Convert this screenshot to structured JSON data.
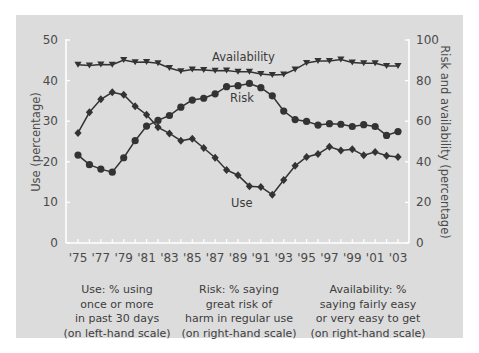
{
  "chart_data": {
    "type": "line",
    "title": "",
    "x": [
      "'75",
      "'76",
      "'77",
      "'78",
      "'79",
      "'80",
      "'81",
      "'82",
      "'83",
      "'84",
      "'85",
      "'86",
      "'87",
      "'88",
      "'89",
      "'90",
      "'91",
      "'92",
      "'93",
      "'94",
      "'95",
      "'96",
      "'97",
      "'98",
      "'99",
      "'00",
      "'01",
      "'02",
      "'03"
    ],
    "x_tick_labels": [
      "'75",
      "'77",
      "'79",
      "'81",
      "'83",
      "'85",
      "'87",
      "'89",
      "'91",
      "'93",
      "'95",
      "'97",
      "'99",
      "'01",
      "'03"
    ],
    "ylabel_left": "Use (percentage)",
    "ylabel_right": "Risk and availability (percentage)",
    "ylim_left": [
      0,
      50
    ],
    "ylim_right": [
      0,
      100
    ],
    "yticks_left": [
      "0",
      "10",
      "20",
      "30",
      "40",
      "50"
    ],
    "yticks_right": [
      "0",
      "20",
      "40",
      "60",
      "80",
      "100"
    ],
    "grid": false,
    "legend_position": "inline labels",
    "series": [
      {
        "name": "Use",
        "axis": "left",
        "marker": "diamond",
        "values": [
          27.1,
          32.2,
          35.4,
          37.1,
          36.5,
          33.7,
          31.6,
          28.5,
          27.0,
          25.2,
          25.7,
          23.4,
          21.0,
          18.0,
          16.7,
          14.0,
          13.8,
          11.9,
          15.5,
          19.0,
          21.2,
          21.9,
          23.7,
          22.8,
          23.1,
          21.6,
          22.4,
          21.5,
          21.2
        ]
      },
      {
        "name": "Risk",
        "axis": "right",
        "marker": "circle",
        "values": [
          43.3,
          38.6,
          36.4,
          34.9,
          42.0,
          50.4,
          57.6,
          60.4,
          62.8,
          66.9,
          70.4,
          71.3,
          73.5,
          77.0,
          77.5,
          78.6,
          76.5,
          72.5,
          65.0,
          60.8,
          59.9,
          58.1,
          58.8,
          58.5,
          57.4,
          58.3,
          57.4,
          53.0,
          54.9
        ]
      },
      {
        "name": "Availability",
        "axis": "right",
        "marker": "triangle-down",
        "values": [
          87.8,
          87.4,
          87.9,
          87.8,
          90.1,
          89.0,
          89.2,
          88.5,
          86.2,
          84.6,
          85.5,
          85.2,
          84.8,
          85.0,
          84.3,
          84.4,
          83.3,
          82.7,
          83.0,
          85.5,
          88.7,
          89.6,
          89.6,
          90.4,
          88.9,
          88.5,
          88.5,
          87.2,
          87.2
        ]
      }
    ],
    "annotations": [
      "Availability",
      "Risk",
      "Use"
    ]
  },
  "labels": {
    "availability": "Availability",
    "risk": "Risk",
    "use": "Use",
    "ylabel_left": "Use (percentage)",
    "ylabel_right": "Risk and availability (percentage)"
  },
  "captions": [
    {
      "lines": [
        "Use: % using",
        "once or more",
        "in past 30 days",
        "(on left-hand scale)"
      ]
    },
    {
      "lines": [
        "Risk: % saying",
        "great risk of",
        "harm in regular use",
        "(on right-hand scale)"
      ]
    },
    {
      "lines": [
        "Availability: %",
        "saying fairly easy",
        "or very easy to get",
        "(on right-hand scale)"
      ]
    }
  ],
  "colors": {
    "panel": "#dcdcdc",
    "axis": "#ffffff",
    "line": "#333333",
    "text": "#4a4a4a"
  }
}
